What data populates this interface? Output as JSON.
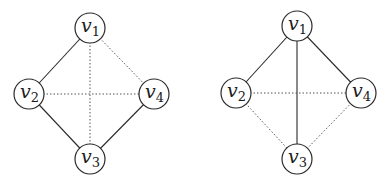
{
  "diagrams": [
    {
      "name": "graph-left",
      "nodes": [
        {
          "id": "v1",
          "base": "v",
          "sub": "1"
        },
        {
          "id": "v2",
          "base": "v",
          "sub": "2"
        },
        {
          "id": "v3",
          "base": "v",
          "sub": "3"
        },
        {
          "id": "v4",
          "base": "v",
          "sub": "4"
        }
      ],
      "edges": [
        {
          "from": "v1",
          "to": "v2",
          "style": "solid"
        },
        {
          "from": "v2",
          "to": "v3",
          "style": "solid"
        },
        {
          "from": "v3",
          "to": "v4",
          "style": "solid"
        },
        {
          "from": "v1",
          "to": "v4",
          "style": "dotted"
        },
        {
          "from": "v1",
          "to": "v3",
          "style": "dotted"
        },
        {
          "from": "v2",
          "to": "v4",
          "style": "dotted"
        }
      ]
    },
    {
      "name": "graph-right",
      "nodes": [
        {
          "id": "v1",
          "base": "v",
          "sub": "1"
        },
        {
          "id": "v2",
          "base": "v",
          "sub": "2"
        },
        {
          "id": "v3",
          "base": "v",
          "sub": "3"
        },
        {
          "id": "v4",
          "base": "v",
          "sub": "4"
        }
      ],
      "edges": [
        {
          "from": "v1",
          "to": "v2",
          "style": "solid"
        },
        {
          "from": "v1",
          "to": "v3",
          "style": "solid"
        },
        {
          "from": "v1",
          "to": "v4",
          "style": "solid"
        },
        {
          "from": "v2",
          "to": "v4",
          "style": "dotted"
        },
        {
          "from": "v2",
          "to": "v3",
          "style": "dotted"
        },
        {
          "from": "v3",
          "to": "v4",
          "style": "dotted"
        }
      ]
    }
  ]
}
